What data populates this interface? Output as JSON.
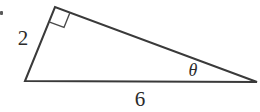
{
  "figure": {
    "type": "right-triangle-diagram",
    "background_color": "#ffffff",
    "stroke_color": "#3a3a3a",
    "text_color": "#2b2b2b",
    "stroke_width": 2
  },
  "labels": {
    "side_a": "2",
    "side_b": "6",
    "angle": "θ"
  },
  "geometry": {
    "vertices": {
      "bottom_left": {
        "x": 25,
        "y": 81
      },
      "apex_right_angle": {
        "x": 55,
        "y": 7
      },
      "right": {
        "x": 257,
        "y": 82
      }
    },
    "right_angle_marker": {
      "present": true,
      "size": 16,
      "at_vertex": "apex_right_angle"
    },
    "label_positions": {
      "side_a": {
        "x": 23,
        "y": 38
      },
      "side_b": {
        "x": 140,
        "y": 99
      },
      "angle": {
        "x": 193,
        "y": 70
      }
    }
  },
  "chart_data": {
    "type": "diagram",
    "shape": "right triangle",
    "vertices": [
      [
        25,
        81
      ],
      [
        55,
        7
      ],
      [
        257,
        82
      ]
    ],
    "edges": [
      {
        "name": "left-leg",
        "from": [
          25,
          81
        ],
        "to": [
          55,
          7
        ],
        "label": "2"
      },
      {
        "name": "hypotenuse-upper",
        "from": [
          55,
          7
        ],
        "to": [
          257,
          82
        ],
        "label": ""
      },
      {
        "name": "base",
        "from": [
          25,
          81
        ],
        "to": [
          257,
          82
        ],
        "label": "6"
      }
    ],
    "angles": [
      {
        "at": [
          55,
          7
        ],
        "label": "",
        "marker": "right-angle-square",
        "value_deg": 90
      },
      {
        "at": [
          257,
          82
        ],
        "label": "θ",
        "marker": "none"
      }
    ],
    "annotations": [
      "2",
      "6",
      "θ"
    ]
  }
}
